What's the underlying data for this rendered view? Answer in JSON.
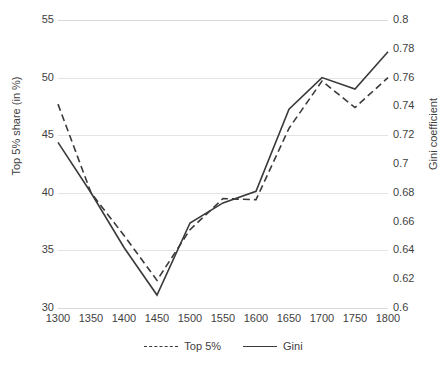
{
  "chart_data": {
    "type": "line",
    "title": "",
    "subtitle": "",
    "xlabel": "",
    "ylabel": "Top 5% share (in %)",
    "y2label": "Gini coefficient",
    "grid": true,
    "legend_position": "bottom",
    "categories": [
      1300,
      1350,
      1400,
      1450,
      1500,
      1550,
      1600,
      1650,
      1700,
      1750,
      1800
    ],
    "xtick_labels": [
      "1300",
      "1350",
      "1400",
      "1450",
      "1500",
      "1550",
      "1600",
      "1650",
      "1700",
      "1750",
      "1800"
    ],
    "ylim": [
      30,
      55
    ],
    "ytick_labels": [
      "55",
      "50",
      "45",
      "40",
      "35",
      "30"
    ],
    "ytick_values": [
      55,
      50,
      45,
      40,
      35,
      30
    ],
    "y2lim": [
      0.6,
      0.8
    ],
    "y2tick_labels": [
      "0.8",
      "0.78",
      "0.76",
      "0.74",
      "0.72",
      "0.7",
      "0.68",
      "0.66",
      "0.64",
      "0.62",
      "0.6"
    ],
    "y2tick_values": [
      0.8,
      0.78,
      0.76,
      0.74,
      0.72,
      0.7,
      0.68,
      0.66,
      0.64,
      0.62,
      0.6
    ],
    "series": [
      {
        "name": "Top 5%",
        "axis": "left",
        "style": "dashed",
        "color": "#3a3a3a",
        "values": [
          47.7,
          40.0,
          36.3,
          32.4,
          36.8,
          39.5,
          39.4,
          45.6,
          49.7,
          47.4,
          50.0
        ]
      },
      {
        "name": "Gini",
        "axis": "right",
        "style": "solid",
        "color": "#3a3a3a",
        "values": [
          0.715,
          0.68,
          0.642,
          0.609,
          0.659,
          0.673,
          0.681,
          0.738,
          0.76,
          0.752,
          0.778
        ]
      }
    ]
  },
  "legend": {
    "items": [
      {
        "label": "Top 5%",
        "style": "dashed"
      },
      {
        "label": "Gini",
        "style": "solid"
      }
    ]
  },
  "colors": {
    "line": "#3a3a3a",
    "grid": "#e4e4e4",
    "text": "#3f3f3f",
    "background": "#ffffff"
  }
}
